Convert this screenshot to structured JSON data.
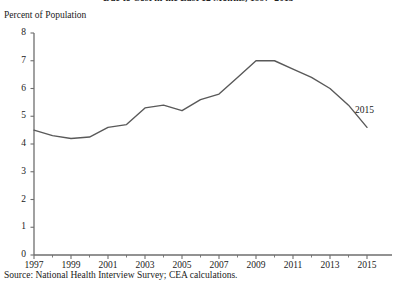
{
  "figure": {
    "title": "Due to Cost in the Last 12 Months, 1997–2015",
    "y_axis_caption": "Percent of Population",
    "source_note": "Source: National Health Interview Survey; CEA calculations.",
    "series_end_annotation": "2015"
  },
  "chart_data": {
    "type": "line",
    "title": "Due to Cost in the Last 12 Months, 1997–2015",
    "subtitle": "",
    "xlabel": "",
    "ylabel": "Percent of Population",
    "xlim": [
      1997,
      2015
    ],
    "ylim": [
      0,
      8
    ],
    "grid": false,
    "legend": false,
    "legend_position": "none",
    "y_ticks": [
      0,
      1,
      2,
      3,
      4,
      5,
      6,
      7,
      8
    ],
    "y_tick_labels": [
      "0",
      "1",
      "2",
      "3",
      "4",
      "5",
      "6",
      "7",
      "8"
    ],
    "x_ticks": [
      1997,
      1999,
      2001,
      2003,
      2005,
      2007,
      2009,
      2011,
      2013,
      2015
    ],
    "x_tick_labels": [
      "1997",
      "1999",
      "2001",
      "2003",
      "2005",
      "2007",
      "2009",
      "2011",
      "2013",
      "2015"
    ],
    "x_minor_ticks": [
      1998,
      2000,
      2002,
      2004,
      2006,
      2008,
      2010,
      2012,
      2014
    ],
    "line_color": "#595959",
    "line_width": 1.4,
    "annotations": [
      {
        "text": "2015",
        "x": 2015,
        "y": 5.2
      }
    ],
    "series": [
      {
        "name": "Percent of Population",
        "x": [
          1997,
          1998,
          1999,
          2000,
          2001,
          2002,
          2003,
          2004,
          2005,
          2006,
          2007,
          2008,
          2009,
          2010,
          2011,
          2012,
          2013,
          2014,
          2015
        ],
        "values": [
          4.5,
          4.3,
          4.2,
          4.25,
          4.6,
          4.7,
          5.3,
          5.4,
          5.2,
          5.6,
          5.8,
          6.4,
          7.0,
          7.0,
          6.7,
          6.4,
          6.0,
          5.4,
          4.6
        ]
      }
    ]
  }
}
